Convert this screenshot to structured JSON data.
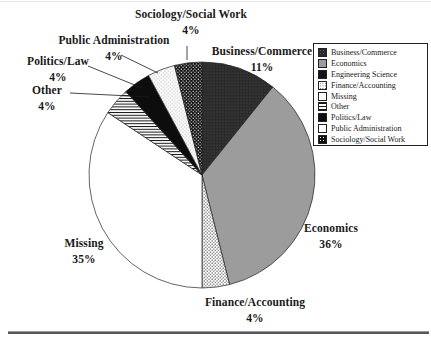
{
  "chart_data": {
    "type": "pie",
    "direction": "clockwise",
    "start_angle_deg": 0,
    "legend_position": "right",
    "slices": [
      {
        "label": "Business/Commerce",
        "value": 11,
        "pct_text": "11%",
        "pattern": "business"
      },
      {
        "label": "Economics",
        "value": 36,
        "pct_text": "36%",
        "pattern": "economics"
      },
      {
        "label": "Engineering Science",
        "value": 0,
        "pct_text": "",
        "pattern": "engineering"
      },
      {
        "label": "Finance/Accounting",
        "value": 4,
        "pct_text": "4%",
        "pattern": "finance"
      },
      {
        "label": "Missing",
        "value": 35,
        "pct_text": "35%",
        "pattern": "missing"
      },
      {
        "label": "Other",
        "value": 4,
        "pct_text": "4%",
        "pattern": "other"
      },
      {
        "label": "Politics/Law",
        "value": 4,
        "pct_text": "4%",
        "pattern": "politics"
      },
      {
        "label": "Public Administration",
        "value": 4,
        "pct_text": "4%",
        "pattern": "pubadmin"
      },
      {
        "label": "Sociology/Social Work",
        "value": 4,
        "pct_text": "4%",
        "pattern": "sociology"
      }
    ]
  },
  "colors": {
    "ink": "#1a1a1a",
    "economics_gray": "#9c9c9c",
    "business_dark": "#2b2b2b",
    "black_fill": "#0d0d0d",
    "background": "#ffffff"
  }
}
